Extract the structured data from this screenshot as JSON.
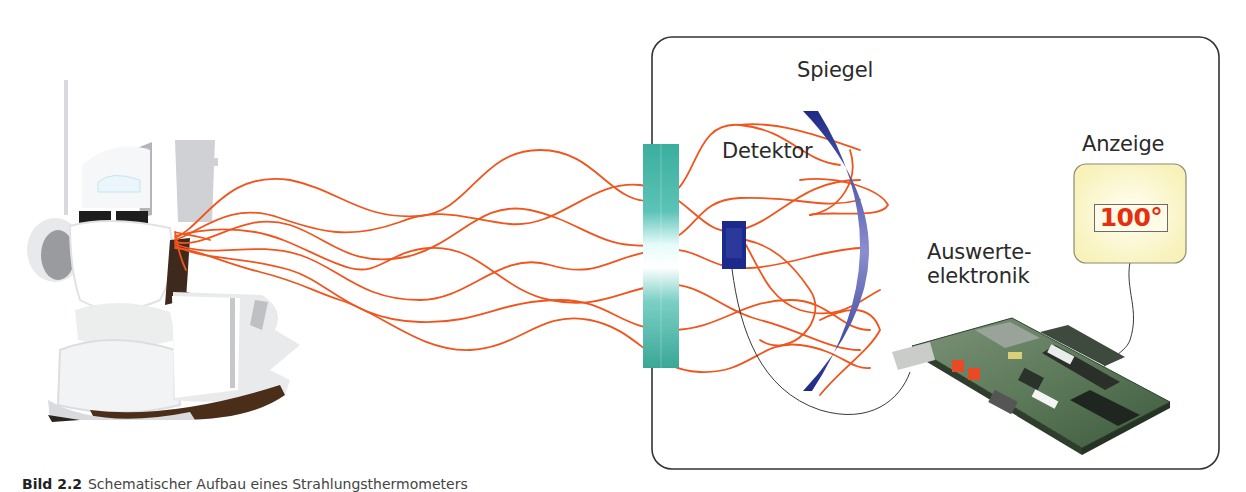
{
  "figure": {
    "labels": {
      "mirror": "Spiegel",
      "detector": "Detektor",
      "display": "Anzeige",
      "electronics_line1": "Auswerte-",
      "electronics_line2": "elektronik"
    },
    "display_value": "100°",
    "caption": {
      "number": "Bild 2.2",
      "text": "Schematischer Aufbau eines Strahlungsthermometers"
    },
    "colors": {
      "radiation": "#f0551e",
      "filter": "#3fb3a3",
      "detector": "#1c2a8c",
      "mirror": "#25307f",
      "display_bg": "#fdf9d2",
      "display_value": "#e62e10",
      "housing_border": "#333333"
    },
    "objects": [
      "teapot-and-cups",
      "optical-filter",
      "detector",
      "mirror",
      "evaluation-board",
      "display"
    ]
  }
}
